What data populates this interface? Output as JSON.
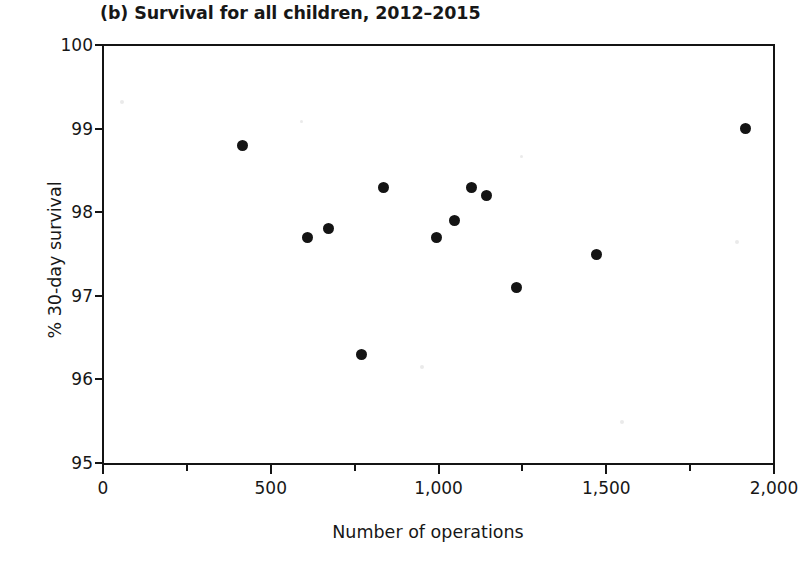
{
  "chart_data": {
    "type": "scatter",
    "title": "(b) Survival for all children, 2012–2015",
    "xlabel": "Number of operations",
    "ylabel": "% 30-day survival",
    "xlim": [
      0,
      2000
    ],
    "ylim": [
      95,
      100
    ],
    "xticks": [
      0,
      500,
      1000,
      1500,
      2000
    ],
    "xtick_labels": [
      "0",
      "500",
      "1,000",
      "1,500",
      "2,000"
    ],
    "xminor_ticks": [
      250,
      750,
      1250,
      1750
    ],
    "yticks": [
      95,
      96,
      97,
      98,
      99,
      100
    ],
    "ytick_labels": [
      "95",
      "96",
      "97",
      "98",
      "99",
      "100"
    ],
    "grid": false,
    "legend": false,
    "marker": "filled-circle",
    "marker_color": "#141414",
    "points": [
      {
        "x": 417,
        "y": 98.8
      },
      {
        "x": 611,
        "y": 97.7
      },
      {
        "x": 673,
        "y": 97.8
      },
      {
        "x": 771,
        "y": 96.3
      },
      {
        "x": 836,
        "y": 98.3
      },
      {
        "x": 994,
        "y": 97.7
      },
      {
        "x": 1049,
        "y": 97.9
      },
      {
        "x": 1099,
        "y": 98.3
      },
      {
        "x": 1142,
        "y": 98.2
      },
      {
        "x": 1232,
        "y": 97.1
      },
      {
        "x": 1472,
        "y": 97.5
      },
      {
        "x": 1914,
        "y": 99.0
      }
    ]
  }
}
